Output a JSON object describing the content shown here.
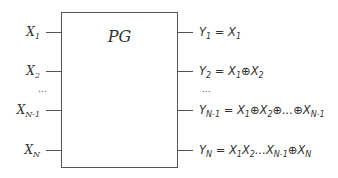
{
  "block": {
    "title": "PG"
  },
  "inputs": [
    {
      "var": "X",
      "sub": "1"
    },
    {
      "var": "X",
      "sub": "2"
    },
    {
      "var": "X",
      "sub": "N-1"
    },
    {
      "var": "X",
      "sub": "N"
    }
  ],
  "input_ellipsis": "...",
  "outputs": [
    {
      "lhs_var": "Y",
      "lhs_sub": "1",
      "rhs": [
        {
          "v": "X",
          "s": "1"
        }
      ]
    },
    {
      "lhs_var": "Y",
      "lhs_sub": "2",
      "rhs": [
        {
          "v": "X",
          "s": "1"
        },
        {
          "op": "⊕"
        },
        {
          "v": "X",
          "s": "2"
        }
      ]
    },
    {
      "lhs_var": "Y",
      "lhs_sub": "N-1",
      "rhs": [
        {
          "v": "X",
          "s": "1"
        },
        {
          "op": "⊕"
        },
        {
          "v": "X",
          "s": "2"
        },
        {
          "op": "⊕...⊕"
        },
        {
          "v": "X",
          "s": "N-1"
        }
      ]
    },
    {
      "lhs_var": "Y",
      "lhs_sub": "N",
      "rhs": [
        {
          "v": "X",
          "s": "1"
        },
        {
          "v": "X",
          "s": "2"
        },
        {
          "op": "..."
        },
        {
          "v": "X",
          "s": "N-1"
        },
        {
          "op": "⊕"
        },
        {
          "v": "X",
          "s": "N"
        }
      ]
    }
  ],
  "output_ellipsis": "...",
  "equals": "="
}
